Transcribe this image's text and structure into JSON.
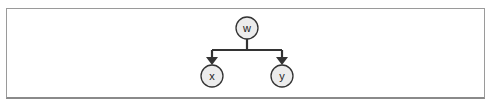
{
  "diagram": {
    "type": "tree",
    "nodes": [
      {
        "id": "w",
        "label": "w",
        "cx": 247,
        "cy": 28,
        "r": 11
      },
      {
        "id": "x",
        "label": "x",
        "cx": 212,
        "cy": 76,
        "r": 11
      },
      {
        "id": "y",
        "label": "y",
        "cx": 282,
        "cy": 76,
        "r": 11
      }
    ],
    "edges": [
      {
        "from": "w",
        "to": "x"
      },
      {
        "from": "w",
        "to": "y"
      }
    ],
    "colors": {
      "node_fill": "#ececec",
      "stroke": "#333333",
      "frame": "#9a9a9a"
    }
  }
}
